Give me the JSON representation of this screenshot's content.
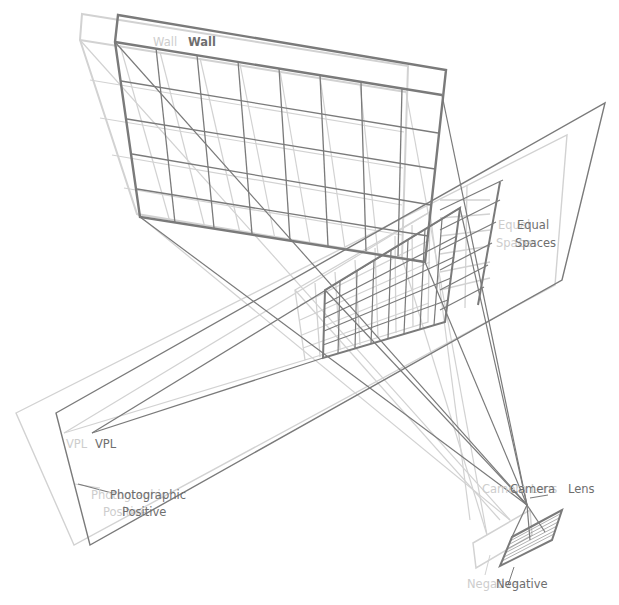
{
  "diagram": {
    "colors": {
      "dark": "#7a7a7a",
      "light": "#d2d2d2",
      "background": "#ffffff"
    },
    "labels": {
      "wall_light": "Wall",
      "wall_dark": "Wall",
      "equal_light_1": "Equal",
      "equal_light_2": "Spaces",
      "equal_dark_1": "Equal",
      "equal_dark_2": "Spaces",
      "vpl_light": "VPL",
      "vpl_dark": "VPL",
      "photo_light_1": "Photographic",
      "photo_light_2": "Positive",
      "photo_dark_1": "Photographic",
      "photo_dark_2": "Positive",
      "camera_light": "Camera Lens",
      "camera_dark": "Camera",
      "lens_dark": "Lens",
      "negative_light": "Negative",
      "negative_dark": "Negative"
    }
  }
}
